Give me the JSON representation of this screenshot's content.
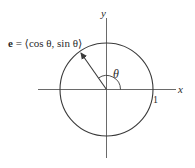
{
  "figure": {
    "vector_label": {
      "bold": "e",
      "rest": " = ⟨cos θ, sin θ⟩"
    },
    "angle_label": "θ",
    "x_axis_label": "x",
    "y_axis_label": "y",
    "unit_label": "1",
    "colors": {
      "stroke": "#3a3a3a",
      "axis": "#6a6a6a",
      "text": "#2b2b2b"
    }
  }
}
